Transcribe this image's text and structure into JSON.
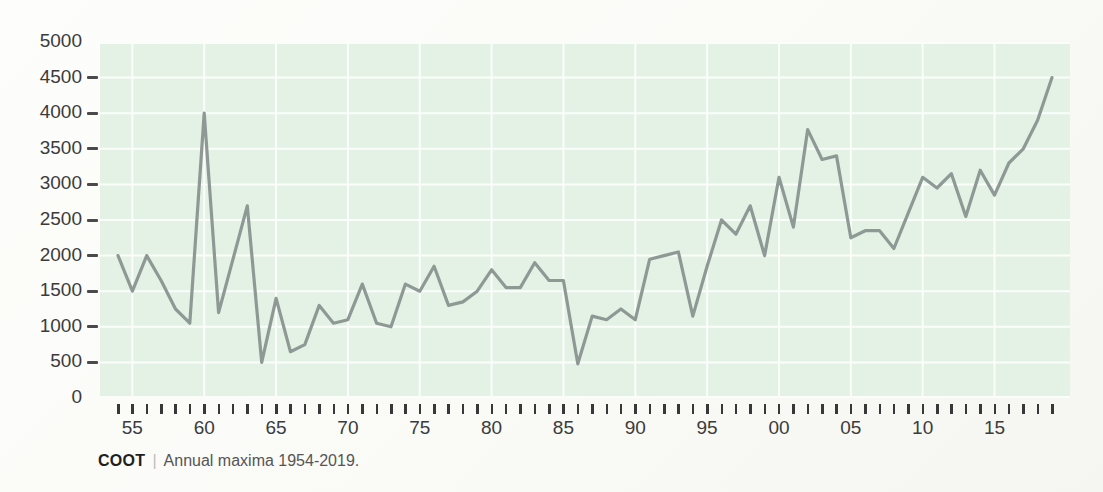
{
  "caption": {
    "source": "COOT",
    "separator": "|",
    "text": "Annual maxima 1954-2019."
  },
  "chart_data": {
    "type": "line",
    "title": "",
    "xlabel": "",
    "ylabel": "",
    "x_start_year": 1954,
    "x_end_year": 2019,
    "x": [
      1954,
      1955,
      1956,
      1957,
      1958,
      1959,
      1960,
      1961,
      1962,
      1963,
      1964,
      1965,
      1966,
      1967,
      1968,
      1969,
      1970,
      1971,
      1972,
      1973,
      1974,
      1975,
      1976,
      1977,
      1978,
      1979,
      1980,
      1981,
      1982,
      1983,
      1984,
      1985,
      1986,
      1987,
      1988,
      1989,
      1990,
      1991,
      1992,
      1993,
      1994,
      1995,
      1996,
      1997,
      1998,
      1999,
      2000,
      2001,
      2002,
      2003,
      2004,
      2005,
      2006,
      2007,
      2008,
      2009,
      2010,
      2011,
      2012,
      2013,
      2014,
      2015,
      2016,
      2017,
      2018,
      2019
    ],
    "values": [
      2000,
      1500,
      2000,
      1650,
      1250,
      1050,
      4000,
      1200,
      1950,
      2700,
      500,
      1400,
      650,
      750,
      1300,
      1050,
      1100,
      1600,
      1050,
      1000,
      1600,
      1500,
      1850,
      1300,
      1350,
      1500,
      1800,
      1550,
      1550,
      1900,
      1650,
      1650,
      480,
      1150,
      1100,
      1250,
      1100,
      1950,
      2000,
      2050,
      1150,
      1850,
      2500,
      2300,
      2700,
      2000,
      3100,
      2400,
      3770,
      3350,
      3400,
      2250,
      2350,
      2350,
      2100,
      2600,
      3100,
      2950,
      3150,
      2550,
      3200,
      2850,
      3300,
      3500,
      3900,
      4500
    ],
    "ylim": [
      0,
      5000
    ],
    "yticks": [
      0,
      500,
      1000,
      1500,
      2000,
      2500,
      3000,
      3500,
      4000,
      4500,
      5000
    ],
    "ytick_labels": [
      "0",
      "500",
      "1000",
      "1500",
      "2000",
      "2500",
      "3000",
      "3500",
      "4000",
      "4500",
      "5000"
    ],
    "ytick_dash_values": [
      500,
      1000,
      1500,
      2000,
      2500,
      3000,
      3500,
      4000,
      4500
    ],
    "xticks_labeled": [
      [
        1955,
        "55"
      ],
      [
        1960,
        "60"
      ],
      [
        1965,
        "65"
      ],
      [
        1970,
        "70"
      ],
      [
        1975,
        "75"
      ],
      [
        1980,
        "80"
      ],
      [
        1985,
        "85"
      ],
      [
        1990,
        "90"
      ],
      [
        1995,
        "95"
      ],
      [
        2000,
        "00"
      ],
      [
        2005,
        "05"
      ],
      [
        2010,
        "10"
      ],
      [
        2015,
        "15"
      ]
    ],
    "grid": true,
    "legend": "none",
    "colors": {
      "line": "#8e9995",
      "plot_bg": "#e4f1e5",
      "grid": "#fafdfa",
      "tick": "#3a3a3a",
      "label": "#3b3b3b",
      "page_bg": "#fbfbf9"
    }
  }
}
